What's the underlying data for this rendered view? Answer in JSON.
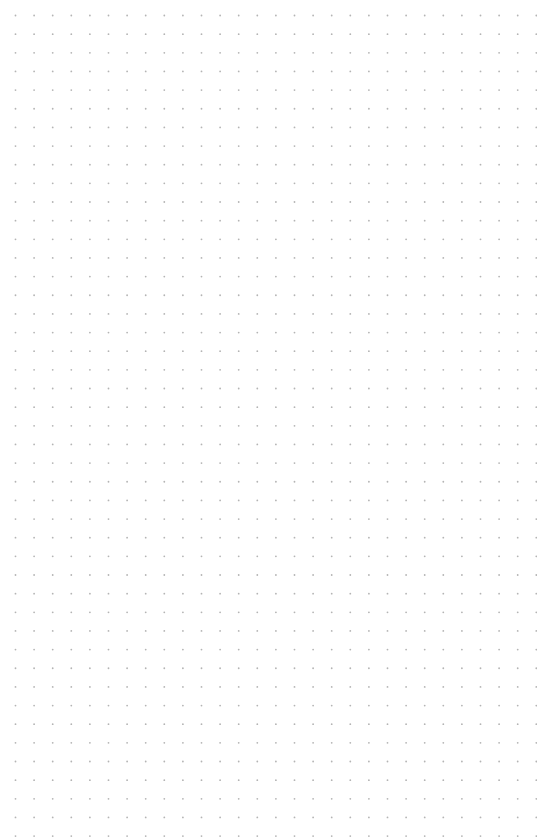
{
  "canvas": {
    "width": 537,
    "height": 839,
    "background_color": "#ffffff"
  },
  "grid": {
    "type": "dot",
    "spacing_x": 18.6,
    "spacing_y": 18.65,
    "offset_x": 15.5,
    "offset_y": 15.5,
    "dot_radius": 0.9,
    "dot_color": "#b4b4b4"
  }
}
